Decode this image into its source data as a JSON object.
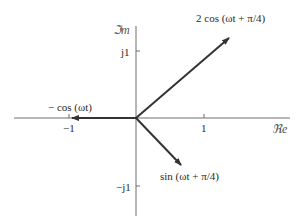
{
  "diagram": {
    "type": "phasor-diagram",
    "axes": {
      "real_label": "ℜe",
      "imag_label": "ℑm",
      "ticks": {
        "neg_one": "−1",
        "one": "1",
        "j1": "j1",
        "neg_j1": "−j1"
      }
    },
    "phasors": [
      {
        "label": "2 cos (ωt + π/4)",
        "magnitude": 2,
        "angle_deg": 45
      },
      {
        "label": "− cos (ωt)",
        "magnitude": 1,
        "angle_deg": 180
      },
      {
        "label": "sin (ωt + π/4)",
        "magnitude": 1,
        "angle_deg": -45
      }
    ],
    "colors": {
      "axis": "#6e6e6e",
      "arrow": "#333333",
      "text": "#2a2a2a"
    }
  }
}
